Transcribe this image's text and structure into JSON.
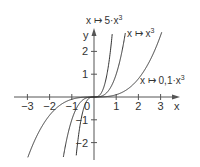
{
  "chart_data": {
    "type": "line",
    "title": "",
    "xlabel": "x",
    "ylabel": "y",
    "xlim": [
      -3.6,
      3.8
    ],
    "ylim": [
      -2.7,
      3.0
    ],
    "grid": false,
    "x_ticks": [
      -3,
      -2,
      -1,
      1,
      2,
      3
    ],
    "x_tick_labels": [
      "−3",
      "−2",
      "−1",
      "1",
      "2",
      "3"
    ],
    "y_ticks": [
      -2,
      -1,
      1,
      2
    ],
    "y_tick_labels": [
      "−2",
      "−1",
      "1",
      "2"
    ],
    "origin_label": "0",
    "series": [
      {
        "name": "x ↦ 5·x³",
        "coefficient": 5,
        "label_pos": {
          "x": 87,
          "y": 24
        }
      },
      {
        "name": "x ↦ x³",
        "coefficient": 1,
        "label_pos": {
          "x": 127,
          "y": 37
        }
      },
      {
        "name": "x ↦ 0,1·x³",
        "coefficient": 0.1,
        "label_pos": {
          "x": 140,
          "y": 84
        }
      }
    ],
    "line_color": "#333333"
  },
  "labels": {
    "x_axis": "x",
    "y_axis": "y",
    "origin": "0",
    "series_0": "x ↦ 5·x",
    "series_1": "x ↦ x",
    "series_2": "x ↦ 0,1·x",
    "exponent": "3"
  }
}
